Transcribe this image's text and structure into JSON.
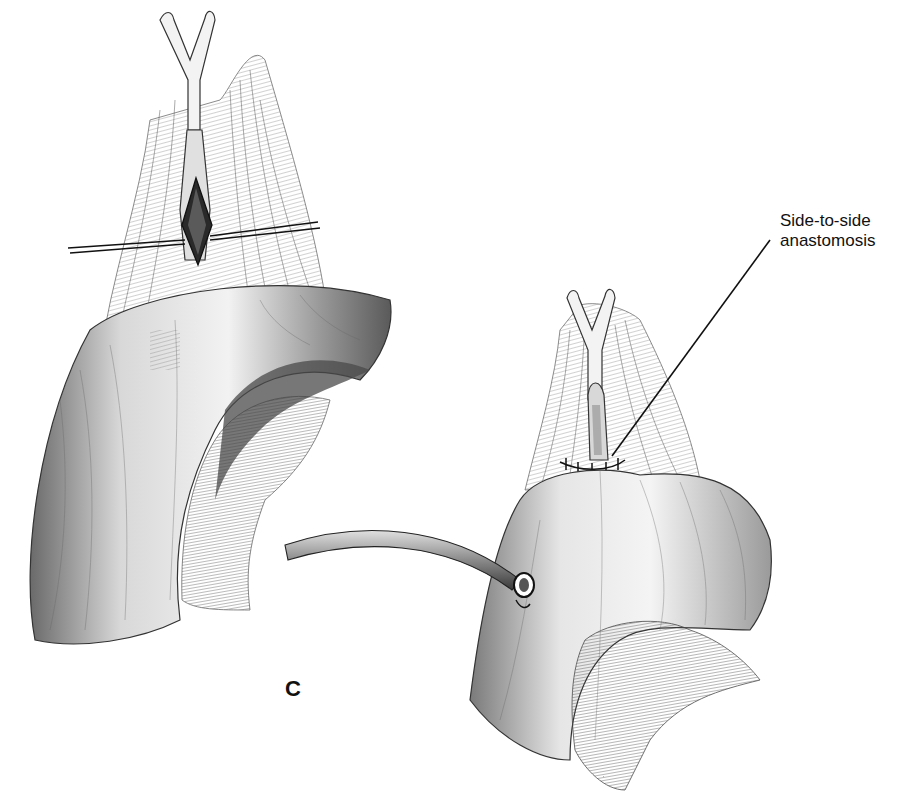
{
  "figure": {
    "panel_letter": "C",
    "callout": {
      "line1": "Side-to-side",
      "line2": "anastomosis"
    },
    "style": {
      "background": "#ffffff",
      "ink": "#1a1a1a",
      "shade_dark": "#4a4a4a",
      "shade_mid": "#8a8a8a",
      "shade_light": "#c8c8c8"
    }
  }
}
